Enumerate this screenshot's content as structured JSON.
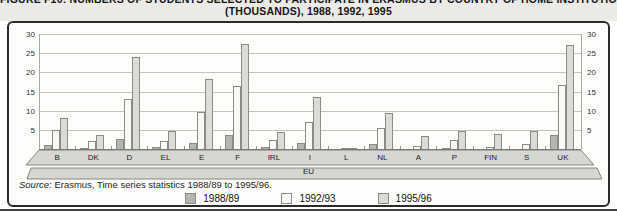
{
  "page": {
    "title_line1": "FIGURE F10: NUMBERS OF STUDENTS SELECTED TO PARTICIPATE IN ERASMUS BY COUNTRY OF HOME INSTITUTION",
    "title_line2": "(THOUSANDS), 1988, 1992, 1995"
  },
  "source": {
    "prefix": "Source:",
    "text": "Erasmus, Time series statistics 1988/89 to 1995/96."
  },
  "eu_label": "EU",
  "legend": {
    "items": [
      {
        "label": "1988/89",
        "color": "#b5b5b1"
      },
      {
        "label": "1992/93",
        "color": "#f8f8f4"
      },
      {
        "label": "1995/96",
        "color": "#dcdcd7"
      }
    ]
  },
  "colors": {
    "series_1988": "#b5b5b1",
    "series_1992": "#f8f8f4",
    "series_1995": "#dcdcd7",
    "bar_outline": "#8b8b87",
    "gridline": "#c4c4c0",
    "base_slab_fill": "#d7d7d2",
    "base_slab_stroke": "#86867f",
    "box_border": "#2b2b2b"
  },
  "chart_data": {
    "type": "bar",
    "title": "(THOUSANDS), 1988, 1992, 1995",
    "xlabel": "EU",
    "ylabel": "",
    "ylim": [
      0,
      30
    ],
    "ytick_step": 5,
    "grid": true,
    "legend_position": "bottom",
    "categories": [
      "B",
      "DK",
      "D",
      "EL",
      "E",
      "F",
      "IRL",
      "I",
      "L",
      "NL",
      "A",
      "P",
      "FIN",
      "S",
      "UK"
    ],
    "series": [
      {
        "name": "1988/89",
        "color": "#b5b5b1",
        "values": [
          1.0,
          0.3,
          2.7,
          0.4,
          1.6,
          3.7,
          0.5,
          1.5,
          0,
          1.2,
          0,
          0.2,
          0,
          0,
          3.7
        ]
      },
      {
        "name": "1992/93",
        "color": "#f8f8f4",
        "values": [
          4.9,
          2.0,
          13.0,
          2.1,
          9.6,
          16.5,
          2.3,
          7.0,
          0.1,
          5.5,
          0.9,
          2.3,
          0.4,
          1.4,
          16.7
        ]
      },
      {
        "name": "1995/96",
        "color": "#dcdcd7",
        "values": [
          8.0,
          3.7,
          24.0,
          4.8,
          18.2,
          27.5,
          4.4,
          13.5,
          0.1,
          9.5,
          3.3,
          4.7,
          3.8,
          4.7,
          27.2
        ]
      }
    ]
  }
}
